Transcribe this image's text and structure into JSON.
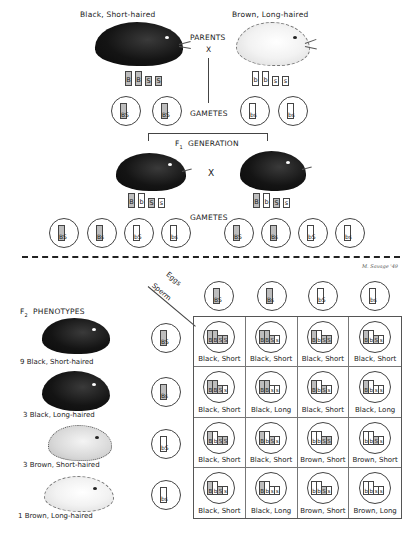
{
  "parents": {
    "label": "PARENTS",
    "cross_symbol": "X",
    "left": {
      "label": "Black, Short-haired",
      "genotype": [
        "B",
        "B",
        "S",
        "S"
      ],
      "gametes": [
        "BS",
        "BS"
      ]
    },
    "right": {
      "label": "Brown, Long-haired",
      "genotype": [
        "b",
        "b",
        "s",
        "s"
      ],
      "gametes": [
        "bs",
        "bs"
      ]
    },
    "gametes_label": "GAMETES"
  },
  "f1": {
    "label_prefix": "F",
    "label_sub": "1",
    "label_suffix": "GENERATION",
    "cross_symbol": "X",
    "left": {
      "genotype": [
        "B",
        "b",
        "S",
        "s"
      ]
    },
    "right": {
      "genotype": [
        "B",
        "b",
        "S",
        "s"
      ]
    },
    "gametes_label": "GAMETES",
    "left_gametes": [
      "BS",
      "Bs",
      "bS",
      "bs"
    ],
    "right_gametes": [
      "BS",
      "Bs",
      "bS",
      "bs"
    ]
  },
  "signature": "M. Savage '49",
  "f2": {
    "title_prefix": "F",
    "title_sub": "2",
    "title_suffix": "PHENOTYPES",
    "phenotypes": [
      {
        "count": "9",
        "label": "Black, Short-haired",
        "coat": "black"
      },
      {
        "count": "3",
        "label": "Black, Long-haired",
        "coat": "black"
      },
      {
        "count": "3",
        "label": "Brown, Short-haired",
        "coat": "brown"
      },
      {
        "count": "1",
        "label": "Brown, Long-haired",
        "coat": "white"
      }
    ],
    "eggs_label": "Eggs",
    "sperm_label": "Sperm",
    "eggs": [
      "BS",
      "Bs",
      "bS",
      "bs"
    ],
    "sperm": [
      "BS",
      "Bs",
      "bS",
      "bs"
    ],
    "punnett": [
      [
        {
          "genotype": "BBSS",
          "phenotype": "Black, Short"
        },
        {
          "genotype": "BBSs",
          "phenotype": "Black, Short"
        },
        {
          "genotype": "BbSS",
          "phenotype": "Black, Short"
        },
        {
          "genotype": "BbSs",
          "phenotype": "Black, Short"
        }
      ],
      [
        {
          "genotype": "BBSs",
          "phenotype": "Black, Short"
        },
        {
          "genotype": "BBss",
          "phenotype": "Black, Long"
        },
        {
          "genotype": "BbSs",
          "phenotype": "Black, Short"
        },
        {
          "genotype": "Bbss",
          "phenotype": "Black, Long"
        }
      ],
      [
        {
          "genotype": "BbSS",
          "phenotype": "Black, Short"
        },
        {
          "genotype": "BbSs",
          "phenotype": "Black, Short"
        },
        {
          "genotype": "bbSS",
          "phenotype": "Brown, Short"
        },
        {
          "genotype": "bbSs",
          "phenotype": "Brown, Short"
        }
      ],
      [
        {
          "genotype": "BbSs",
          "phenotype": "Black, Short"
        },
        {
          "genotype": "Bbss",
          "phenotype": "Black, Long"
        },
        {
          "genotype": "bbSs",
          "phenotype": "Brown, Short"
        },
        {
          "genotype": "bbss",
          "phenotype": "Brown, Long"
        }
      ]
    ]
  },
  "colors": {
    "dominant_fill": "#bdbdbd",
    "recessive_fill": "#ffffff",
    "ink": "#1a1a1a"
  }
}
